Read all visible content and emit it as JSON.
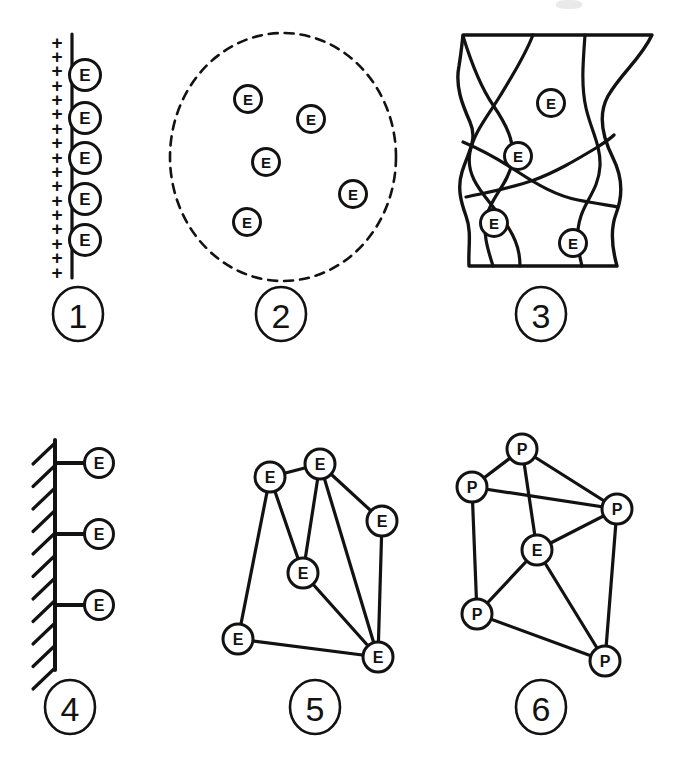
{
  "figure": {
    "background_color": "#ffffff",
    "ink_color": "#121212",
    "panel_count": 6,
    "columns": 3,
    "rows": 2
  },
  "panels": [
    {
      "number": "1",
      "name": "charged-surface-panel",
      "description": "Vertical line with plus signs on the left and electrons bound on the line",
      "node_label": "E",
      "node_count": 5,
      "plus_label": "+",
      "plus_count": 17,
      "nodes": [
        {
          "label": "E",
          "cx": 85,
          "cy": 75
        },
        {
          "label": "E",
          "cx": 85,
          "cy": 118
        },
        {
          "label": "E",
          "cx": 85,
          "cy": 158
        },
        {
          "label": "E",
          "cx": 85,
          "cy": 199
        },
        {
          "label": "E",
          "cx": 85,
          "cy": 240
        }
      ],
      "label_center": {
        "x": 78,
        "y": 314
      }
    },
    {
      "number": "2",
      "name": "free-electron-gas-panel",
      "description": "Dashed circular boundary enclosing five free electrons",
      "node_label": "E",
      "node_count": 5,
      "boundary_style": "dashed-circle",
      "nodes": [
        {
          "label": "E",
          "cx": 248,
          "cy": 99
        },
        {
          "label": "E",
          "cx": 311,
          "cy": 119
        },
        {
          "label": "E",
          "cx": 266,
          "cy": 162
        },
        {
          "label": "E",
          "cx": 353,
          "cy": 194
        },
        {
          "label": "E",
          "cx": 247,
          "cy": 222
        }
      ],
      "label_center": {
        "x": 281,
        "y": 314
      }
    },
    {
      "number": "3",
      "name": "grain-domain-panel",
      "description": "Irregular block partitioned by curved boundaries with four electrons",
      "node_label": "E",
      "node_count": 4,
      "nodes": [
        {
          "label": "E",
          "cx": 551,
          "cy": 103
        },
        {
          "label": "E",
          "cx": 518,
          "cy": 156
        },
        {
          "label": "E",
          "cx": 494,
          "cy": 223
        },
        {
          "label": "E",
          "cx": 573,
          "cy": 243
        }
      ],
      "label_center": {
        "x": 541,
        "y": 314
      }
    },
    {
      "number": "4",
      "name": "fixed-wall-panel",
      "description": "Hatched fixed wall with three electrons tethered by horizontal links",
      "node_label": "E",
      "node_count": 3,
      "hatch_count": 11,
      "nodes": [
        {
          "label": "E",
          "cx": 99,
          "cy": 463
        },
        {
          "label": "E",
          "cx": 99,
          "cy": 534
        },
        {
          "label": "E",
          "cx": 99,
          "cy": 605
        }
      ],
      "label_center": {
        "x": 70,
        "y": 707
      }
    },
    {
      "number": "5",
      "name": "electron-network-panel",
      "description": "Network of six electrons joined by straight bonds",
      "node_label": "E",
      "node_count": 6,
      "edge_count": 10,
      "nodes": [
        {
          "id": "a",
          "label": "E",
          "cx": 270,
          "cy": 477
        },
        {
          "id": "b",
          "label": "E",
          "cx": 320,
          "cy": 464
        },
        {
          "id": "c",
          "label": "E",
          "cx": 382,
          "cy": 521
        },
        {
          "id": "d",
          "label": "E",
          "cx": 303,
          "cy": 573
        },
        {
          "id": "e",
          "label": "E",
          "cx": 238,
          "cy": 639
        },
        {
          "id": "f",
          "label": "E",
          "cx": 378,
          "cy": 657
        }
      ],
      "edges": [
        [
          "a",
          "b"
        ],
        [
          "a",
          "d"
        ],
        [
          "a",
          "e"
        ],
        [
          "b",
          "c"
        ],
        [
          "b",
          "d"
        ],
        [
          "b",
          "f"
        ],
        [
          "c",
          "f"
        ],
        [
          "d",
          "f"
        ],
        [
          "e",
          "f"
        ]
      ],
      "label_center": {
        "x": 315,
        "y": 707
      }
    },
    {
      "number": "6",
      "name": "proton-electron-network-panel",
      "description": "Network of five protons surrounding one central electron",
      "node_labels": [
        "P",
        "E"
      ],
      "node_count": 6,
      "proton_count": 5,
      "electron_count": 1,
      "edge_count": 10,
      "nodes": [
        {
          "id": "p1",
          "label": "P",
          "cx": 522,
          "cy": 449
        },
        {
          "id": "p2",
          "label": "P",
          "cx": 472,
          "cy": 487
        },
        {
          "id": "p3",
          "label": "P",
          "cx": 617,
          "cy": 509
        },
        {
          "id": "e1",
          "label": "E",
          "cx": 537,
          "cy": 550
        },
        {
          "id": "p4",
          "label": "P",
          "cx": 477,
          "cy": 614
        },
        {
          "id": "p5",
          "label": "P",
          "cx": 605,
          "cy": 661
        }
      ],
      "edges": [
        [
          "p1",
          "p2"
        ],
        [
          "p1",
          "p3"
        ],
        [
          "p1",
          "e1"
        ],
        [
          "p2",
          "p3"
        ],
        [
          "p2",
          "p4"
        ],
        [
          "p3",
          "e1"
        ],
        [
          "p3",
          "p5"
        ],
        [
          "e1",
          "p4"
        ],
        [
          "e1",
          "p5"
        ],
        [
          "p4",
          "p5"
        ]
      ],
      "label_center": {
        "x": 541,
        "y": 707
      }
    }
  ]
}
